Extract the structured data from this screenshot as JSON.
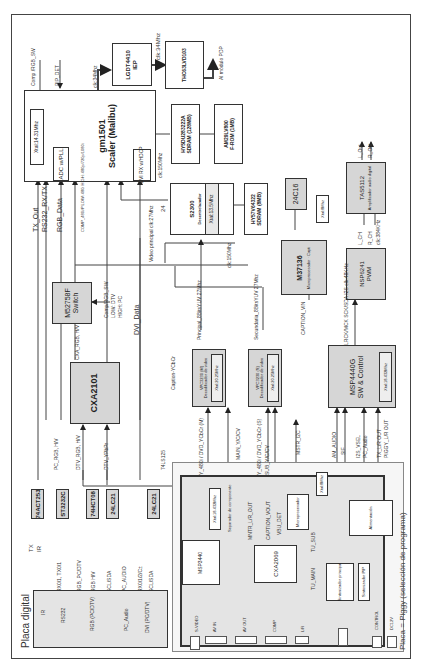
{
  "diagram": {
    "board_digital": "Placa digital",
    "board_piggy": "Placa = Piggy (selección de programa)",
    "scaler": {
      "name": "gm1501",
      "sub": "Scaler (Malibu)",
      "xtal": "Xtal:14.31Mhz",
      "adc": "ADC w/PLL",
      "dvi": "DVI RX w/HDCP"
    },
    "lgdt": {
      "name": "LGDT4410",
      "sub": "IEP"
    },
    "thc": {
      "name": "THC63LVD103"
    },
    "pdp_out": "Al módulo PDP",
    "clk34a": "clk:34Mhz",
    "clk34b": "clk:34Mhz",
    "sdram128": {
      "name": "HY5DU283222A",
      "sub": "SDRAM (128MB)"
    },
    "flash": {
      "name": "AM29LV800",
      "sub": "F-ROM (1MB)"
    },
    "clk150a": "clk:150Mhz",
    "s2300": {
      "name": "S2300",
      "sub": "Desentrelazador",
      "xtal": "Xtal:13.5Mhz"
    },
    "sdram8": {
      "name": "HY57V64322",
      "sub": "SDRAM (8MB)"
    },
    "clk150b": "clk:150Mhz",
    "eeprom24c16": "24C16",
    "xtal8": "Xtal:8Mhz",
    "m37136": {
      "name": "M37136",
      "sub": "Microprocesador · Capti"
    },
    "caption_vin": "CAPTION_VIN",
    "tas": {
      "name": "TAS5112",
      "sub": "Amplificador audio digital"
    },
    "l_out": "L_Out",
    "r_out": "R_Out",
    "nsp": {
      "name": "NSP6241",
      "sub": "PWM"
    },
    "l_ch": "L_CH",
    "r_ch": "R_CH",
    "clk384": "clk:384KHz",
    "i2s_label": "LRCK/MCK SCK/SDA  I2S clk:48KHz",
    "msp4440": {
      "name": "MSP4440G",
      "sub": "SW & Control",
      "xtal": "Xtal:18.432Mhz"
    },
    "vpc_m": {
      "name": "VPC3230 (M)",
      "sub": "Decodificador de video",
      "xtal": "Xtal:20.25Mhz"
    },
    "vpc_s": {
      "name": "VPC3230 (S)",
      "sub": "Decodificador de video",
      "xtal": "Xtal:20.25Mhz"
    },
    "principal_label": "Principal_8BitsYUV 27Mhz",
    "secundaria_label": "Secundaria_8BitsYUV 27Mhz",
    "caption_ycbcr": "Caption-YCbCr",
    "video_principal": "Video principal clk:27Mhz",
    "bus24": "24",
    "m52758": {
      "name": "M52758F",
      "sub": "Switch"
    },
    "comp_rgb_sw2": "Comp/RGB_SW",
    "low_dtv": "LOW: DTV",
    "high_pc": "HIGH: PC",
    "dvi_data": "DVI_Data",
    "cxa2101": "CXA2101",
    "cxa_rgb": "CXA_RGB, H/V",
    "pc_rgb": "PC_RGB, H/V",
    "dtv_rgb": "DTV_RGB, H/V",
    "dtv_ypbpr": "DTV_YPbPr",
    "ls125": "74LS125",
    "tx_out": "TX_Out",
    "rs232_rxtx": "RS232_RX/TX",
    "rgb_data": "RGB_Data",
    "comp_note": "COMP_480i/P  LOW: 480i  HIGH: 480p/720p/1080i",
    "comp_rgb_sw": "Comp /RGB_SW",
    "pip_det": "PIP_DET",
    "chip_74act": "74ACT253",
    "chip_st3232": "ST3232C",
    "chip_74hct": "74HCT08",
    "chip_24lc21a": "24LC21",
    "chip_24lc21b": "24LC21",
    "tx": "TX",
    "ir": "IR",
    "rx01": "RX0/1, TX0/1",
    "rgb_pcdtv": "RGB_PC/DTV",
    "rgb_hv": "RGB H/V",
    "scl_sda1": "SCL/SDA",
    "pc_audio_sig": "PC_AUDIO",
    "rx012": "RX0/1/2/C±",
    "scl_sda2": "SCL/SDA",
    "connectors": [
      "IR",
      "RS232",
      "RGB (PC/DTV)",
      "PC_Audio",
      "DVI (PC/DTV)"
    ],
    "piggy": {
      "msp3440": "MSP3440",
      "xtal18": "Xtal:18.432Mhz",
      "sep_comp": "Separador de componente",
      "cxa2069": "CXA2069",
      "micro": "Microprocesador",
      "xtal8": "Xtal:8Mhz",
      "alim": "Alimentación",
      "sint": "Sintonizador principal",
      "sint2": "Sintonizador PIP",
      "sif": "SIF",
      "am_audio": "AM_AUDIO",
      "main_y": "MAIN_Y/C/CV",
      "sub_y": "SUB_Y/C/CV",
      "mstr_i2c": "MSTR_I2C",
      "y480": "Y_480i / DVD_YCbCr (M)",
      "y480s": "Y_480i / DVD_YCbCr (S)",
      "main_i2c": "MAIN_I2C",
      "tx_lr_out": "TX_L/R OUT",
      "piggy_lr": "PIGGY_L/R OUT",
      "i2s_vsel": "I2S_VSEL",
      "pc_audio": "PC_Audio",
      "tuner_lr": "TU_MAIN",
      "tu_sub": "TU_SUB",
      "ports": [
        "S-VIDEO",
        "AV IN",
        "AV OUT",
        "COMP",
        "L/R",
        "CONTROL",
        "DC12V"
      ],
      "mntr": "MNTR_L/R_OUT",
      "vbu": "VBU_DET",
      "caption_vout": "CAPTION_VOUT"
    }
  }
}
